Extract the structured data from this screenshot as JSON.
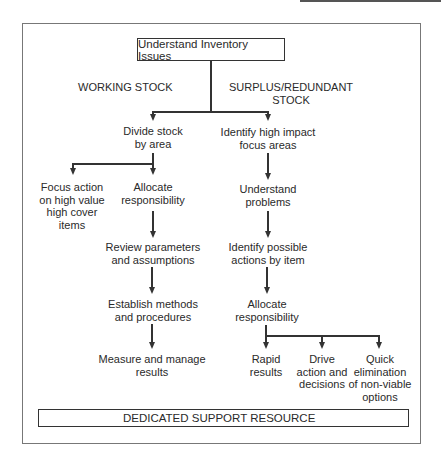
{
  "diagram": {
    "root": "Understand Inventory Issues",
    "branches": {
      "left_heading": "WORKING STOCK",
      "right_heading_line1": "SURPLUS/REDUNDANT",
      "right_heading_line2": "STOCK"
    },
    "working_stock": {
      "divide": [
        "Divide stock",
        "by area"
      ],
      "focus": [
        "Focus action",
        "on high value",
        "high cover",
        "items"
      ],
      "allocate": [
        "Allocate",
        "responsibility"
      ],
      "review": [
        "Review parameters",
        "and assumptions"
      ],
      "establish": [
        "Establish methods",
        "and procedures"
      ],
      "measure": [
        "Measure and manage",
        "results"
      ]
    },
    "surplus_stock": {
      "identify_focus": [
        "Identify high impact",
        "focus areas"
      ],
      "understand": [
        "Understand",
        "problems"
      ],
      "identify_actions": [
        "Identify possible",
        "actions by item"
      ],
      "allocate": [
        "Allocate",
        "responsibility"
      ],
      "outcomes": [
        [
          "Rapid",
          "results"
        ],
        [
          "Drive",
          "action and",
          "decisions"
        ],
        [
          "Quick",
          "elimination",
          "of non-viable",
          "options"
        ]
      ]
    },
    "footer": "DEDICATED SUPPORT RESOURCE"
  }
}
